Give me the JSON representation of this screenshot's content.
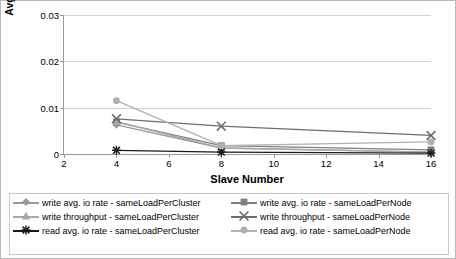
{
  "chart_data": {
    "type": "line",
    "title": "",
    "xlabel": "Slave Number",
    "ylabel_lines": [
      "Avg. I/O & Throughput",
      "(normalized)"
    ],
    "x": [
      4,
      8,
      16
    ],
    "xlim": [
      2,
      16
    ],
    "xticks": [
      2,
      4,
      6,
      8,
      10,
      12,
      14,
      16
    ],
    "ylim": [
      0,
      0.03
    ],
    "yticks": [
      0,
      0.01,
      0.02,
      0.03
    ],
    "ytick_labels": [
      "0",
      "0.01",
      "0.02",
      "0.03"
    ],
    "grid": "horizontal",
    "legend_position": "below",
    "series": [
      {
        "name": "write avg. io rate - sameLoadPerCluster",
        "color": "#9a9a9a",
        "marker": "diamond",
        "values": [
          0.0063,
          0.0013,
          0.0004
        ]
      },
      {
        "name": "write avg. io rate - sameLoadPerNode",
        "color": "#7f7f7f",
        "marker": "square",
        "values": [
          0.0069,
          0.0018,
          0.0009
        ]
      },
      {
        "name": "write throughput - sameLoadPerCluster",
        "color": "#a8a8a8",
        "marker": "triangle",
        "values": [
          0.007,
          0.0013,
          0.0004
        ]
      },
      {
        "name": "write throughput - sameLoadPerNode",
        "color": "#6e6e6e",
        "marker": "cross",
        "values": [
          0.0076,
          0.006,
          0.004
        ]
      },
      {
        "name": "read avg. io rate - sameLoadPerCluster",
        "color": "#1a1a1a",
        "marker": "star",
        "values": [
          0.0008,
          0.0004,
          0.0002
        ]
      },
      {
        "name": "read avg. io rate - sameLoadPerNode",
        "color": "#b0b0b0",
        "marker": "circle",
        "values": [
          0.0115,
          0.0018,
          0.0026
        ]
      }
    ]
  }
}
